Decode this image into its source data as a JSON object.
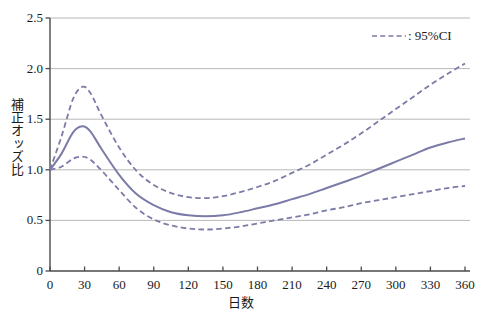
{
  "chart_data": {
    "type": "line",
    "title": "",
    "xlabel": "日数",
    "ylabel": "補正オッズ比",
    "xlim": [
      0,
      360
    ],
    "ylim": [
      0,
      2.5
    ],
    "grid": true,
    "grid_axis": "y",
    "legend_position": "top-right",
    "legend": [
      {
        "label": ": 95%CI",
        "style": "dashed"
      }
    ],
    "xticks": [
      0,
      30,
      60,
      90,
      120,
      150,
      180,
      210,
      240,
      270,
      300,
      330,
      360
    ],
    "xtick_labels": [
      "0",
      "30",
      "60",
      "90",
      "120",
      "150",
      "180",
      "210",
      "240",
      "270",
      "300",
      "330",
      "360"
    ],
    "yticks": [
      0,
      0.5,
      1.0,
      1.5,
      2.0,
      2.5
    ],
    "ytick_labels": [
      "0",
      "0.5",
      "1.0",
      "1.5",
      "2.0",
      "2.5"
    ],
    "series": [
      {
        "name": "補正オッズ比",
        "style": "solid",
        "color": "#7b7ba8",
        "x": [
          0,
          10,
          20,
          28,
          35,
          45,
          60,
          75,
          90,
          105,
          120,
          135,
          150,
          165,
          180,
          195,
          210,
          225,
          240,
          255,
          270,
          285,
          300,
          315,
          330,
          345,
          360
        ],
        "values": [
          1.0,
          1.16,
          1.37,
          1.43,
          1.38,
          1.2,
          0.95,
          0.76,
          0.65,
          0.58,
          0.55,
          0.54,
          0.55,
          0.58,
          0.62,
          0.66,
          0.71,
          0.76,
          0.82,
          0.88,
          0.94,
          1.01,
          1.08,
          1.15,
          1.22,
          1.27,
          1.31
        ]
      },
      {
        "name": "95%CI 上限",
        "style": "dashed",
        "color": "#7b7ba8",
        "x": [
          0,
          10,
          20,
          28,
          35,
          45,
          60,
          75,
          90,
          105,
          120,
          135,
          150,
          165,
          180,
          195,
          210,
          225,
          240,
          255,
          270,
          285,
          300,
          315,
          330,
          345,
          360
        ],
        "values": [
          1.0,
          1.33,
          1.7,
          1.82,
          1.76,
          1.53,
          1.22,
          0.99,
          0.85,
          0.77,
          0.73,
          0.72,
          0.74,
          0.78,
          0.83,
          0.89,
          0.97,
          1.05,
          1.15,
          1.25,
          1.36,
          1.48,
          1.6,
          1.72,
          1.84,
          1.95,
          2.05
        ]
      },
      {
        "name": "95%CI 下限",
        "style": "dashed",
        "color": "#7b7ba8",
        "x": [
          0,
          10,
          20,
          28,
          35,
          45,
          60,
          75,
          90,
          105,
          120,
          135,
          150,
          165,
          180,
          195,
          210,
          225,
          240,
          255,
          270,
          285,
          300,
          315,
          330,
          345,
          360
        ],
        "values": [
          1.0,
          1.03,
          1.11,
          1.13,
          1.1,
          0.99,
          0.8,
          0.62,
          0.51,
          0.45,
          0.42,
          0.41,
          0.42,
          0.44,
          0.47,
          0.5,
          0.53,
          0.56,
          0.6,
          0.63,
          0.67,
          0.7,
          0.73,
          0.76,
          0.79,
          0.82,
          0.84
        ]
      }
    ],
    "colors": {
      "line": "#7b7ba8",
      "grid": "#b0b0b0",
      "axis": "#4a4a4a",
      "text": "#1a1a1a",
      "background": "#ffffff"
    }
  }
}
